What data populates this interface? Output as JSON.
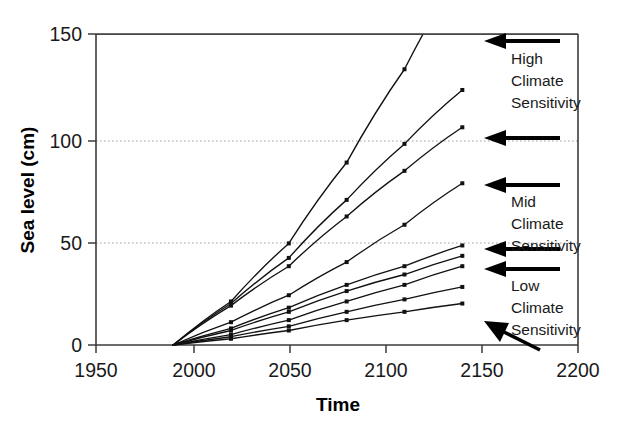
{
  "chart_data": {
    "type": "line",
    "title": "",
    "xlabel": "Time",
    "ylabel": "Sea level (cm)",
    "xlim": [
      1950,
      2200
    ],
    "ylim": [
      0,
      150
    ],
    "xticks": [
      1950,
      2000,
      2050,
      2100,
      2150,
      2200
    ],
    "xticklabels": [
      "1950",
      "2000",
      "2050",
      "2100",
      "2150",
      "2200"
    ],
    "yticks": [
      0,
      50,
      100,
      150
    ],
    "yticklabels": [
      "0",
      "50",
      "100",
      "150"
    ],
    "gridlines_y": [
      50,
      100
    ],
    "grid": "horizontal-dotted",
    "legend": "none",
    "marker": "square",
    "x": [
      1990,
      2020,
      2050,
      2080,
      2110,
      2140
    ],
    "series": [
      {
        "name": "High climate sensitivity - highest scenario",
        "values": [
          0,
          21,
          49,
          88,
          133,
          182
        ]
      },
      {
        "name": "High climate sensitivity - upper scenario",
        "values": [
          0,
          20,
          42,
          70,
          97,
          123
        ]
      },
      {
        "name": "High climate sensitivity - lower scenario",
        "values": [
          0,
          19,
          38,
          62,
          84,
          105
        ]
      },
      {
        "name": "Mid climate sensitivity - high scenario",
        "values": [
          0,
          11,
          24,
          40,
          58,
          78
        ]
      },
      {
        "name": "Mid climate sensitivity - mid scenario",
        "values": [
          0,
          8,
          18,
          29,
          38,
          48
        ]
      },
      {
        "name": "Mid climate sensitivity - low scenario",
        "values": [
          0,
          7,
          16,
          26,
          34,
          43
        ]
      },
      {
        "name": "Low climate sensitivity - high scenario",
        "values": [
          0,
          5,
          12,
          21,
          29,
          38
        ]
      },
      {
        "name": "Low climate sensitivity - mid scenario",
        "values": [
          0,
          4,
          9,
          16,
          22,
          28
        ]
      },
      {
        "name": "Low climate sensitivity - low scenario",
        "values": [
          0,
          3,
          7,
          12,
          16,
          20
        ]
      }
    ],
    "annotations": [
      {
        "id": "high",
        "text_lines": [
          "High",
          "Climate",
          "Sensitivity"
        ],
        "points_to_value": 150,
        "arrow": "left"
      },
      {
        "id": "mid",
        "text_lines": [
          "Mid",
          "Climate",
          "Sensitivity"
        ],
        "points_to_value": 78,
        "arrow": "left"
      },
      {
        "id": "low",
        "text_lines": [
          "Low",
          "Climate",
          "Sensitivity"
        ],
        "points_to_value": 38,
        "arrow": "left"
      }
    ]
  },
  "annotation_labels": {
    "high_line1": "High",
    "high_line2": "Climate",
    "high_line3": "Sensitivity",
    "mid_line1": "Mid",
    "mid_line2": "Climate",
    "mid_line3": "Sensitivity",
    "low_line1": "Low",
    "low_line2": "Climate",
    "low_line3": "Sensitivity"
  },
  "axis": {
    "x_title": "Time",
    "y_title": "Sea level (cm)",
    "x_tick_1": "1950",
    "x_tick_2": "2000",
    "x_tick_3": "2050",
    "x_tick_4": "2100",
    "x_tick_5": "2150",
    "x_tick_6": "2200",
    "y_tick_1": "0",
    "y_tick_2": "50",
    "y_tick_3": "100",
    "y_tick_4": "150"
  },
  "colors": {
    "line": "#111111",
    "axis": "#3b3b3b",
    "grid": "#9a9a9a",
    "background": "#ffffff",
    "text": "#1a1a1a"
  }
}
